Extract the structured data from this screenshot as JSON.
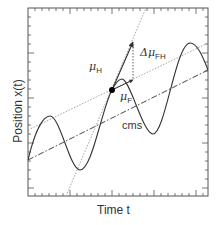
{
  "figure": {
    "x_axis_label": "Time t",
    "y_axis_label": "Position x(t)",
    "annotations": {
      "mu_h": {
        "symbol": "μ",
        "subscript": "H"
      },
      "mu_f": {
        "symbol": "μ",
        "subscript": "F"
      },
      "delta_mu_fh": {
        "symbol": "Δμ",
        "subscript": "FH"
      },
      "cms": "cms"
    },
    "colors": {
      "axis": "#555555",
      "curve": "#333333",
      "dotted_lines": "#9a9a9a",
      "point": "#000000"
    }
  }
}
